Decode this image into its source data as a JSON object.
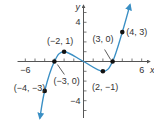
{
  "chart_data": {
    "type": "line",
    "title": "",
    "xlabel": "x",
    "ylabel": "y",
    "xlim": [
      -6.8,
      7.0
    ],
    "ylim": [
      -5.8,
      5.8
    ],
    "grid": false,
    "x_ticks": [
      -6,
      -5,
      -4,
      -3,
      -2,
      -1,
      1,
      2,
      3,
      4,
      5,
      6
    ],
    "y_ticks": [
      -5,
      -4,
      -3,
      -2,
      -1,
      1,
      2,
      3,
      4,
      5
    ],
    "x_tick_labels": [
      {
        "value": -6,
        "label": "−6"
      },
      {
        "value": 6,
        "label": "6"
      }
    ],
    "y_tick_labels": [
      {
        "value": 4,
        "label": "4"
      },
      {
        "value": -4,
        "label": "−4"
      }
    ],
    "curve": {
      "description": "smooth cubic-like curve passing through labeled points, arrows at both ends",
      "color": "#3a8fc4",
      "points": [
        [
          -4.5,
          -5.8
        ],
        [
          -4,
          -3
        ],
        [
          -3,
          0
        ],
        [
          -2,
          1
        ],
        [
          0,
          0
        ],
        [
          2,
          -1
        ],
        [
          3,
          0
        ],
        [
          4,
          3
        ],
        [
          4.8,
          5.8
        ]
      ]
    },
    "marked_points": [
      {
        "x": -4,
        "y": -3,
        "label": "(−4, −3)"
      },
      {
        "x": -3,
        "y": 0,
        "label": "(−3, 0)"
      },
      {
        "x": -2,
        "y": 1,
        "label": "(−2, 1)"
      },
      {
        "x": 2,
        "y": -1,
        "label": "(2, −1)"
      },
      {
        "x": 3,
        "y": 0,
        "label": "(3, 0)"
      },
      {
        "x": 4,
        "y": 3,
        "label": "(4, 3)"
      }
    ],
    "colors": {
      "curve": "#3a8fc4",
      "points": "#111111",
      "axis": "#555555",
      "text": "#333333"
    }
  }
}
